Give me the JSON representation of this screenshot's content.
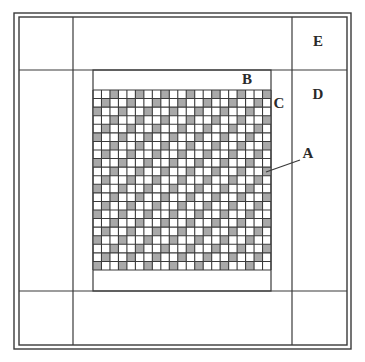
{
  "diagram": {
    "type": "quilt-layout",
    "canvas": {
      "width": 365,
      "height": 362,
      "background": "#ffffff"
    },
    "colors": {
      "line": "#3a3a3a",
      "shade": "#a9a9a9",
      "cell_bg": "#ffffff"
    },
    "outer_border": {
      "outer": {
        "x1": 14,
        "y1": 13,
        "x2": 351,
        "y2": 349
      },
      "inner": {
        "x1": 19,
        "y1": 17,
        "x2": 347,
        "y2": 345
      }
    },
    "outer_grid": {
      "vertical_lines_x": [
        73,
        292
      ],
      "horizontal_lines_y": [
        70,
        291
      ]
    },
    "inner_frame": {
      "x1": 93,
      "y1": 70,
      "x2": 271,
      "y2": 291
    },
    "checker_grid": {
      "x": 93,
      "y": 90,
      "width": 178,
      "height": 180,
      "cols": 21,
      "rows": 21,
      "shade_rule": "(row + col) % 3 == 2"
    },
    "labels": [
      {
        "id": "A",
        "text": "A",
        "x": 308,
        "y": 153
      },
      {
        "id": "B",
        "text": "B",
        "x": 247,
        "y": 79
      },
      {
        "id": "C",
        "text": "C",
        "x": 279,
        "y": 103
      },
      {
        "id": "D",
        "text": "D",
        "x": 318,
        "y": 94
      },
      {
        "id": "E",
        "text": "E",
        "x": 318,
        "y": 41
      }
    ],
    "leader_line_A": {
      "x1": 300,
      "y1": 160,
      "x2": 266,
      "y2": 172
    }
  }
}
